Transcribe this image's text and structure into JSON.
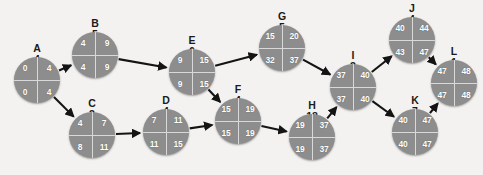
{
  "diagram": {
    "node_fill": "#8d8d8d",
    "node_divider": "#d9d9d9",
    "edge_color": "#141414",
    "text_color": "#ffffff",
    "label_color": "#1a1a1a",
    "background": "#f3f2f0",
    "nodes": [
      {
        "id": "A",
        "duration": "4",
        "es": "0",
        "ef": "4",
        "ls": "0",
        "lf": "4",
        "x": 37,
        "y": 80,
        "label_x": 37,
        "label_y": 43
      },
      {
        "id": "B",
        "duration": "5",
        "es": "4",
        "ef": "9",
        "ls": "4",
        "lf": "9",
        "x": 95,
        "y": 55,
        "label_x": 95,
        "label_y": 18
      },
      {
        "id": "C",
        "duration": "3",
        "es": "4",
        "ef": "7",
        "ls": "8",
        "lf": "11",
        "x": 92,
        "y": 135,
        "label_x": 92,
        "label_y": 98
      },
      {
        "id": "D",
        "duration": "4",
        "es": "7",
        "ef": "11",
        "ls": "11",
        "lf": "15",
        "x": 166,
        "y": 132,
        "label_x": 166,
        "label_y": 95
      },
      {
        "id": "E",
        "duration": "6",
        "es": "9",
        "ef": "15",
        "ls": "9",
        "lf": "15",
        "x": 192,
        "y": 72,
        "label_x": 192,
        "label_y": 35
      },
      {
        "id": "F",
        "duration": "4",
        "es": "15",
        "ef": "19",
        "ls": "15",
        "lf": "19",
        "x": 238,
        "y": 121,
        "label_x": 238,
        "label_y": 84
      },
      {
        "id": "G",
        "duration": "5",
        "es": "15",
        "ef": "20",
        "ls": "32",
        "lf": "37",
        "x": 282,
        "y": 48,
        "label_x": 282,
        "label_y": 11
      },
      {
        "id": "H",
        "duration": "18",
        "es": "19",
        "ef": "37",
        "ls": "19",
        "lf": "37",
        "x": 312,
        "y": 137,
        "label_x": 312,
        "label_y": 100
      },
      {
        "id": "I",
        "duration": "3",
        "es": "37",
        "ef": "40",
        "ls": "37",
        "lf": "40",
        "x": 353,
        "y": 87,
        "label_x": 353,
        "label_y": 50
      },
      {
        "id": "J",
        "duration": "4",
        "es": "40",
        "ef": "44",
        "ls": "43",
        "lf": "47",
        "x": 412,
        "y": 40,
        "label_x": 412,
        "label_y": 3
      },
      {
        "id": "K",
        "duration": "7",
        "es": "40",
        "ef": "47",
        "ls": "40",
        "lf": "47",
        "x": 415,
        "y": 132,
        "label_x": 415,
        "label_y": 95
      },
      {
        "id": "L",
        "duration": "1",
        "es": "47",
        "ef": "48",
        "ls": "47",
        "lf": "48",
        "x": 454,
        "y": 83,
        "label_x": 454,
        "label_y": 46
      }
    ],
    "edges": [
      {
        "from": "A",
        "to": "B"
      },
      {
        "from": "A",
        "to": "C"
      },
      {
        "from": "B",
        "to": "E"
      },
      {
        "from": "C",
        "to": "D"
      },
      {
        "from": "D",
        "to": "F"
      },
      {
        "from": "E",
        "to": "G"
      },
      {
        "from": "E",
        "to": "F"
      },
      {
        "from": "F",
        "to": "H"
      },
      {
        "from": "G",
        "to": "I"
      },
      {
        "from": "H",
        "to": "I"
      },
      {
        "from": "I",
        "to": "J"
      },
      {
        "from": "I",
        "to": "K"
      },
      {
        "from": "J",
        "to": "L"
      },
      {
        "from": "K",
        "to": "L"
      }
    ]
  }
}
